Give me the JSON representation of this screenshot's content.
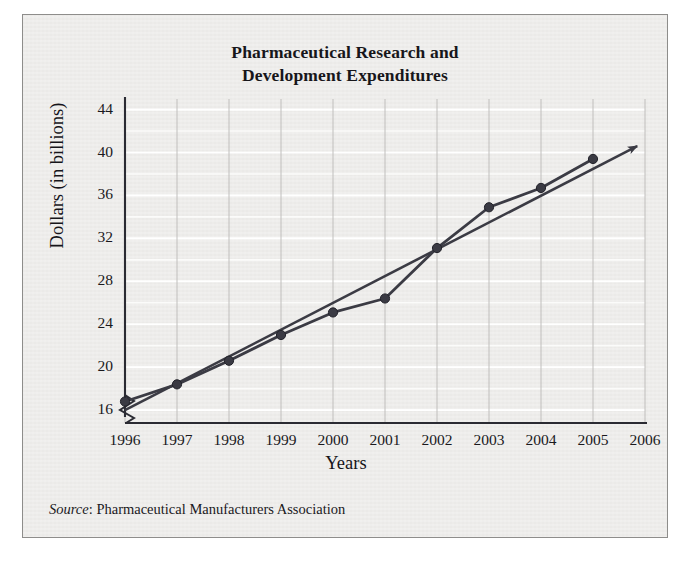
{
  "figure": {
    "title_line1": "Pharmaceutical Research and",
    "title_line2": "Development Expenditures",
    "source_label": "Source",
    "source_separator": ": ",
    "source_text": "Pharmaceutical Manufacturers Association",
    "background_color": "#edecea",
    "frame_color": "#8e8d8b",
    "ink_color": "#3b3b44",
    "text_color": "#17161a"
  },
  "chart_data": {
    "type": "line",
    "title": "Pharmaceutical Research and Development Expenditures",
    "xlabel": "Years",
    "ylabel": "Dollars (in billions)",
    "x": [
      1996,
      1997,
      1998,
      1999,
      2000,
      2001,
      2002,
      2003,
      2004,
      2005
    ],
    "categories": [
      "1996",
      "1997",
      "1998",
      "1999",
      "2000",
      "2001",
      "2002",
      "2003",
      "2004",
      "2005"
    ],
    "values": [
      16.8,
      18.4,
      20.6,
      23.0,
      25.1,
      26.4,
      31.1,
      34.9,
      36.7,
      39.4
    ],
    "series": [
      {
        "name": "R&D expenditures",
        "marker": "circle",
        "values": [
          16.8,
          18.4,
          20.6,
          23.0,
          25.1,
          26.4,
          31.1,
          34.9,
          36.7,
          39.4
        ]
      },
      {
        "name": "trend line",
        "marker": "none",
        "arrow": true,
        "x_start": 1996,
        "y_start": 16.0,
        "x_end": 2005.85,
        "y_end": 40.6
      }
    ],
    "xlim": [
      1996,
      2006
    ],
    "ylim": [
      14.8,
      44.8
    ],
    "xticks": [
      1996,
      1997,
      1998,
      1999,
      2000,
      2001,
      2002,
      2003,
      2004,
      2005,
      2006
    ],
    "xtick_labels": [
      "1996",
      "1997",
      "1998",
      "1999",
      "2000",
      "2001",
      "2002",
      "2003",
      "2004",
      "2005",
      "2006"
    ],
    "yticks": [
      16,
      20,
      24,
      28,
      32,
      36,
      40,
      44
    ],
    "ytick_labels": [
      "16",
      "20",
      "24",
      "28",
      "32",
      "36",
      "40",
      "44"
    ],
    "minor_y_step": 2,
    "grid": true,
    "grid_vertical": true,
    "grid_horizontal": true,
    "axis_break": true,
    "legend": false,
    "line_color": "#3b3b44",
    "marker_color": "#3a3a43"
  }
}
